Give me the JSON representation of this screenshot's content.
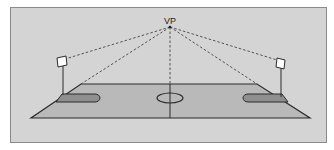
{
  "diagram": {
    "vanishing_point": {
      "label": "VP",
      "x": 170,
      "y": 27
    },
    "colors": {
      "background": "#d4d4d4",
      "court_fill": "#b9b9b9",
      "key_fill": "#8f8f8f",
      "line": "#333333",
      "dashed_line": "#444444",
      "backboard_fill": "#ffffff"
    },
    "court": {
      "top_left": [
        81,
        84
      ],
      "top_right": [
        257,
        84
      ],
      "bottom_right": [
        310,
        118
      ],
      "bottom_left": [
        31,
        118
      ]
    },
    "elements": [
      "court-outline",
      "center-line",
      "center-circle",
      "left-key",
      "right-key",
      "left-backboard",
      "right-backboard",
      "perspective-lines"
    ]
  }
}
